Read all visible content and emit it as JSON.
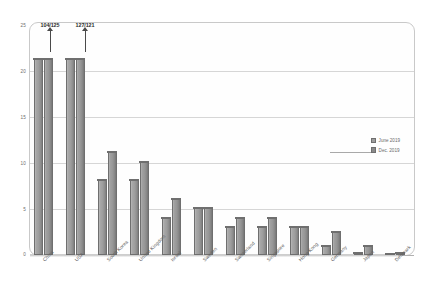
{
  "chart_data": {
    "type": "bar",
    "title": "",
    "subtitle": "",
    "xlabel": "",
    "ylabel": "",
    "ylim": [
      0,
      25
    ],
    "yticks": [
      "0",
      "5",
      "10",
      "15",
      "20",
      "25"
    ],
    "grid": true,
    "legend_position": "right",
    "categories": [
      "China",
      "USA",
      "South Korea",
      "United Kingdom",
      "Israel",
      "Sweden",
      "Switzerland",
      "Singapore",
      "Hong Kong",
      "Germany",
      "Japan",
      "Denmark"
    ],
    "series": [
      {
        "name": "June 2019",
        "color": "#9d9d9d",
        "values": [
          21,
          21,
          8,
          8,
          4,
          5,
          3,
          3,
          3,
          1,
          0.2,
          0.05
        ]
      },
      {
        "name": "Dec. 2019",
        "color": "#8a8a8a",
        "values": [
          21,
          21,
          11,
          10,
          6,
          5,
          4,
          4,
          3,
          2.5,
          1,
          0.2
        ]
      }
    ],
    "annotations": [
      {
        "category": "China",
        "label": "104/125",
        "note": "bar clipped, true values exceed axis"
      },
      {
        "category": "USA",
        "label": "127/121",
        "note": "bar clipped, true values exceed axis"
      }
    ]
  },
  "legend": {
    "items": [
      {
        "label": "June 2019"
      },
      {
        "label": "Dec. 2019"
      }
    ]
  }
}
